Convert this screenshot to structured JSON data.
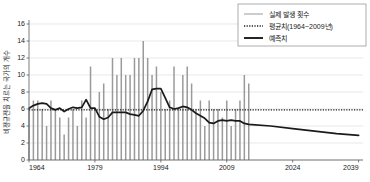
{
  "chart_data": {
    "type": "bar",
    "title": "",
    "xlabel": "",
    "ylabel": "비정규전을 치르는 국가의 개수",
    "xlim": [
      1964,
      2040
    ],
    "ylim": [
      0,
      16
    ],
    "yticks": [
      0,
      2,
      4,
      6,
      8,
      10,
      12,
      14,
      16
    ],
    "xticks": [
      1964,
      1979,
      1994,
      2009,
      2024,
      2039
    ],
    "grid": true,
    "legend_position": "top-right",
    "legend": [
      {
        "label": "실제 발생 횟수",
        "style": "thin-line",
        "color": "#9a9a9a"
      },
      {
        "label": "평균치(1964~2009년)",
        "style": "dotted-line",
        "color": "#1a1a1a"
      },
      {
        "label": "예측치",
        "style": "thick-line",
        "color": "#1a1a1a"
      }
    ],
    "series": [
      {
        "name": "실제 발생 횟수",
        "type": "bar",
        "color": "#9a9a9a",
        "x": [
          1964,
          1965,
          1966,
          1967,
          1968,
          1969,
          1970,
          1971,
          1972,
          1973,
          1974,
          1975,
          1976,
          1977,
          1978,
          1979,
          1980,
          1981,
          1982,
          1983,
          1984,
          1985,
          1986,
          1987,
          1988,
          1989,
          1990,
          1991,
          1992,
          1993,
          1994,
          1995,
          1996,
          1997,
          1998,
          1999,
          2000,
          2001,
          2002,
          2003,
          2004,
          2005,
          2006,
          2007,
          2008,
          2009,
          2010,
          2011,
          2012,
          2013,
          2014
        ],
        "values": [
          6,
          7,
          7,
          6,
          4,
          7,
          6,
          5,
          3,
          5,
          6,
          4,
          7,
          5,
          11,
          6,
          8,
          9,
          6,
          12,
          10,
          12,
          10,
          10,
          12,
          12,
          14,
          12,
          10,
          11,
          8,
          6,
          7,
          11,
          6,
          10,
          11,
          9,
          6,
          7,
          4,
          7,
          6,
          6,
          5,
          7,
          4,
          6,
          7,
          10,
          9
        ]
      },
      {
        "name": "평균치(1964~2009년)",
        "type": "line",
        "style": "dotted",
        "color": "#1a1a1a",
        "value": 5.9,
        "x_start": 1964,
        "x_end": 2040
      },
      {
        "name": "예측치",
        "type": "line",
        "style": "solid",
        "color": "#1a1a1a",
        "x": [
          1964,
          1965,
          1966,
          1967,
          1968,
          1969,
          1970,
          1971,
          1972,
          1973,
          1974,
          1975,
          1976,
          1977,
          1978,
          1979,
          1980,
          1981,
          1982,
          1983,
          1984,
          1985,
          1986,
          1987,
          1988,
          1989,
          1990,
          1991,
          1992,
          1993,
          1994,
          1995,
          1996,
          1997,
          1998,
          1999,
          2000,
          2001,
          2002,
          2003,
          2004,
          2005,
          2006,
          2007,
          2008,
          2009,
          2010,
          2011,
          2012,
          2013,
          2014,
          2019,
          2024,
          2029,
          2034,
          2039
        ],
        "values": [
          6.1,
          6.4,
          6.6,
          6.7,
          6.6,
          6.1,
          5.9,
          6.1,
          5.7,
          6.0,
          6.2,
          6.1,
          6.2,
          7.1,
          6.1,
          6.1,
          5.1,
          4.8,
          5.0,
          5.6,
          5.6,
          5.6,
          5.6,
          5.4,
          5.3,
          5.2,
          5.8,
          6.9,
          8.3,
          8.4,
          8.4,
          7.3,
          6.2,
          6.0,
          6.1,
          6.3,
          6.2,
          5.9,
          5.5,
          5.2,
          4.9,
          4.4,
          4.3,
          4.6,
          4.7,
          4.6,
          4.7,
          4.6,
          4.6,
          4.3,
          4.2,
          4.0,
          3.7,
          3.4,
          3.1,
          2.9
        ]
      }
    ]
  },
  "axes": {
    "x_tick_labels": [
      "1964",
      "1979",
      "1994",
      "2009",
      "2024",
      "2039"
    ],
    "y_tick_labels": [
      "0",
      "2",
      "4",
      "6",
      "8",
      "10",
      "12",
      "14",
      "16"
    ],
    "y_axis_title": "비정규전을 치르는 국가의 개수"
  },
  "legend": {
    "items": [
      {
        "label": "실제 발생 횟수"
      },
      {
        "label": "평균치(1964~2009년)"
      },
      {
        "label": "예측치"
      }
    ]
  },
  "colors": {
    "bar": "#9a9a9a",
    "forecast_line": "#1a1a1a",
    "mean_line": "#1a1a1a",
    "grid": "#d9d9d9",
    "axis": "#5a5a5a",
    "background": "#ffffff"
  }
}
